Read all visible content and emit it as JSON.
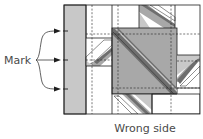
{
  "labels": {
    "mark": "Mark",
    "caption": "Wrong side"
  },
  "colors": {
    "outline": "#1e1e1e",
    "light_gray": "#c8c8c8",
    "mid_gray": "#a8a8a8",
    "dark_gray": "#6e6e6e",
    "white": "#ffffff",
    "text": "#4a4a4a"
  },
  "marks": [
    {
      "name": "mark-top",
      "y": 31
    },
    {
      "name": "mark-middle",
      "y": 60
    },
    {
      "name": "mark-bottom",
      "y": 89
    }
  ]
}
